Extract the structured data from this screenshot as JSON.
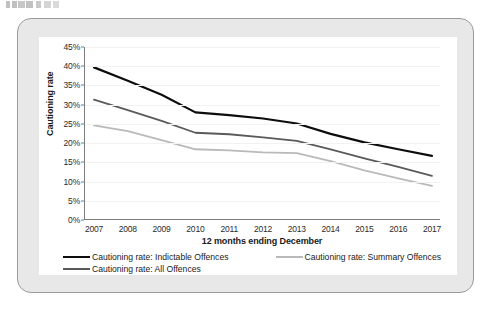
{
  "page": {
    "top_partial_text": "",
    "background_color": "#ffffff",
    "frame_color": "#e8e8e8",
    "panel_color": "#ffffff"
  },
  "chart_data": {
    "type": "line",
    "title": "",
    "xlabel": "12 months ending December",
    "ylabel": "Cautioning rate",
    "categories": [
      "2007",
      "2008",
      "2009",
      "2010",
      "2011",
      "2012",
      "2013",
      "2014",
      "2015",
      "2016",
      "2017"
    ],
    "x": [
      2007,
      2008,
      2009,
      2010,
      2011,
      2012,
      2013,
      2014,
      2015,
      2016,
      2017
    ],
    "ylim": [
      0,
      45
    ],
    "ytick_labels": [
      "0%",
      "5%",
      "10%",
      "15%",
      "20%",
      "25%",
      "30%",
      "35%",
      "40%",
      "45%"
    ],
    "ytick_values": [
      0,
      5,
      10,
      15,
      20,
      25,
      30,
      35,
      40,
      45
    ],
    "grid": true,
    "legend_position": "bottom",
    "series": [
      {
        "name": "Cautioning rate: Indictable Offences",
        "color": "#0d0d0d",
        "width": 2.2,
        "values": [
          39.7,
          36.2,
          32.6,
          28.0,
          27.3,
          26.4,
          25.1,
          22.4,
          20.2,
          18.4,
          16.7
        ]
      },
      {
        "name": "Cautioning rate: Summary Offences",
        "color": "#b9b9b9",
        "width": 1.8,
        "values": [
          24.6,
          23.1,
          20.8,
          18.4,
          18.1,
          17.6,
          17.4,
          15.3,
          12.9,
          10.8,
          8.9
        ]
      },
      {
        "name": "Cautioning rate: All Offences",
        "color": "#5a5a5a",
        "width": 1.8,
        "values": [
          31.3,
          28.6,
          25.8,
          22.7,
          22.3,
          21.5,
          20.6,
          18.4,
          16.0,
          13.8,
          11.5
        ]
      }
    ]
  },
  "legend": {
    "entries": [
      {
        "label": "Cautioning rate: Indictable Offences",
        "color": "#0d0d0d",
        "width": 2.4
      },
      {
        "label": "Cautioning rate: Summary Offences",
        "color": "#b9b9b9",
        "width": 2.0
      },
      {
        "label": "Cautioning rate: All Offences",
        "color": "#5a5a5a",
        "width": 2.0
      }
    ]
  }
}
